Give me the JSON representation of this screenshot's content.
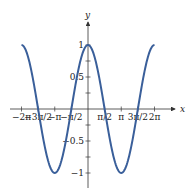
{
  "chart_data": {
    "type": "line",
    "title": "",
    "function": "y = cos(x)",
    "xlabel": "x",
    "ylabel": "y",
    "xlim": [
      -6.2832,
      6.2832
    ],
    "ylim": [
      -1,
      1
    ],
    "grid": false,
    "legend": null,
    "line_color": "#3a5f9a",
    "x_ticks": [
      {
        "value": -6.2832,
        "label": "−2π"
      },
      {
        "value": -4.7124,
        "label": "−3π/2"
      },
      {
        "value": -3.1416,
        "label": "−π"
      },
      {
        "value": -1.5708,
        "label": "−π/2"
      },
      {
        "value": 1.5708,
        "label": "π/2"
      },
      {
        "value": 3.1416,
        "label": "π"
      },
      {
        "value": 4.7124,
        "label": "3π/2"
      },
      {
        "value": 6.2832,
        "label": "2π"
      }
    ],
    "y_ticks": [
      {
        "value": 1,
        "label": "1"
      },
      {
        "value": 0.5,
        "label": "0.5"
      },
      {
        "value": -0.5,
        "label": "−0.5"
      },
      {
        "value": -1,
        "label": "−1"
      }
    ],
    "series": [
      {
        "name": "cos(x)",
        "x": [
          -6.2832,
          -4.7124,
          -3.1416,
          -1.5708,
          0,
          1.5708,
          3.1416,
          4.7124,
          6.2832
        ],
        "values": [
          1,
          0,
          -1,
          0,
          1,
          0,
          -1,
          0,
          1
        ]
      }
    ]
  }
}
